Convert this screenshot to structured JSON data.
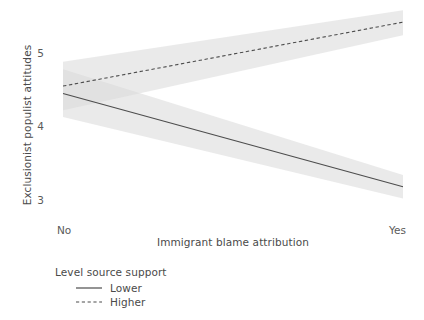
{
  "chart_data": {
    "type": "line",
    "title": "",
    "subtitle": "",
    "xlabel": "Immigrant blame attribution",
    "ylabel": "Exclusionist populist attitudes",
    "x": [
      0,
      1
    ],
    "xticklabels": [
      "No",
      "Yes"
    ],
    "xlim": [
      0,
      1
    ],
    "yticks": [
      3,
      4,
      5
    ],
    "yticklabels": [
      "3",
      "4",
      "5"
    ],
    "ylim": [
      2.75,
      5.62
    ],
    "grid": false,
    "legend": {
      "title": "Level source support",
      "position": "bottom-left-outside",
      "entries": [
        {
          "label": "Lower",
          "style": "solid",
          "color": "#4d4d4d"
        },
        {
          "label": "Higher",
          "style": "dashed",
          "color": "#4d4d4d"
        }
      ]
    },
    "series": [
      {
        "name": "Lower",
        "style": "solid",
        "color": "#4d4d4d",
        "x": [
          0,
          1
        ],
        "values": [
          4.45,
          3.18
        ],
        "ci_lower": [
          4.13,
          3.02
        ],
        "ci_upper": [
          4.78,
          3.34
        ],
        "band_color": "#d9d9d9"
      },
      {
        "name": "Higher",
        "style": "dashed",
        "color": "#4d4d4d",
        "x": [
          0,
          1
        ],
        "values": [
          4.55,
          5.42
        ],
        "ci_lower": [
          4.22,
          5.24
        ],
        "ci_upper": [
          4.88,
          5.58
        ],
        "band_color": "#d9d9d9"
      }
    ],
    "colors": {
      "line": "#4d4d4d",
      "band": "#d9d9d9",
      "text": "#4a4a4a",
      "background": "#ffffff"
    }
  }
}
